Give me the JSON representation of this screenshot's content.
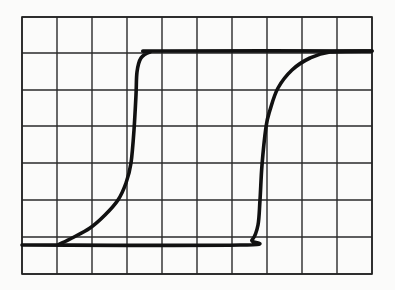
{
  "figure": {
    "grid": {
      "columns": 10,
      "rows": 7,
      "left": 22,
      "top": 17,
      "right": 372,
      "bottom": 274,
      "vertical_lines_x": [
        22,
        57,
        92,
        127,
        162,
        197,
        232,
        267,
        302,
        337,
        372
      ],
      "horizontal_lines_y": [
        17,
        53,
        90,
        126,
        163,
        200,
        237,
        274
      ]
    },
    "colors": {
      "background": "#fbfbfa",
      "grid": "#2a2a2a",
      "trace": "#111111"
    },
    "trace": {
      "type": "hysteresis-loop",
      "upper_level_y": 51,
      "lower_level_y": 245,
      "ascending_branch": [
        [
          58,
          245
        ],
        [
          72,
          238
        ],
        [
          90,
          228
        ],
        [
          105,
          215
        ],
        [
          118,
          200
        ],
        [
          126,
          183
        ],
        [
          131,
          163
        ],
        [
          134,
          130
        ],
        [
          136,
          95
        ],
        [
          137,
          72
        ],
        [
          141,
          58
        ],
        [
          150,
          52
        ],
        [
          162,
          51
        ],
        [
          372,
          51
        ]
      ],
      "descending_branch": [
        [
          372,
          51
        ],
        [
          330,
          52
        ],
        [
          310,
          58
        ],
        [
          292,
          70
        ],
        [
          278,
          88
        ],
        [
          270,
          110
        ],
        [
          266,
          127
        ],
        [
          262,
          165
        ],
        [
          260,
          200
        ],
        [
          258,
          225
        ],
        [
          252,
          240
        ],
        [
          240,
          245
        ],
        [
          22,
          245
        ]
      ]
    }
  }
}
